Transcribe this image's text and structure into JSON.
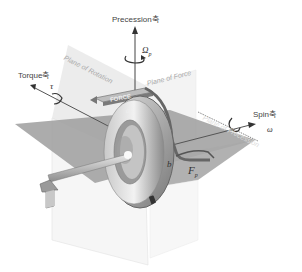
{
  "axes": {
    "precession": "Precession축",
    "torque": "Torque축",
    "spin": "Spin축"
  },
  "planes": {
    "rotation": "Plane of Rotation",
    "force": "Plane of Force",
    "precession": "Plane of Precession"
  },
  "labels": {
    "force_arrow": "FORCE",
    "omega_p": "Ω",
    "omega_p_sub": "p",
    "tau": "τ",
    "omega": "ω",
    "a": "a",
    "b": "b",
    "fp": "F",
    "fp_sub": "p"
  },
  "colors": {
    "plane_fill": "#9a9a9a",
    "axis_line": "#555555",
    "wheel_dark": "#6e6e6e",
    "wheel_light": "#d8d8d8",
    "text": "#444444"
  }
}
